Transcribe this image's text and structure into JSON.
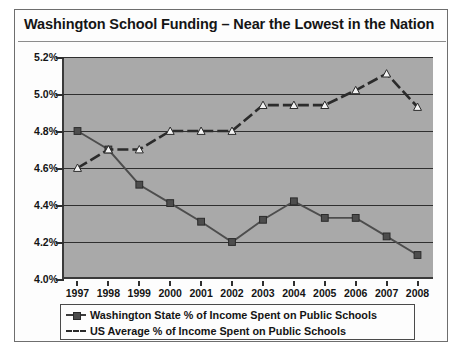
{
  "chart_data": {
    "type": "line",
    "title": "Washington School Funding –  Near the Lowest in the Nation",
    "xlabel": "",
    "ylabel": "",
    "ylim": [
      4.0,
      5.2
    ],
    "ytick_labels": [
      "5.2%",
      "5.0%",
      "4.8%",
      "4.6%",
      "4.4%",
      "4.2%",
      "4.0%"
    ],
    "ytick_values": [
      5.2,
      5.0,
      4.8,
      4.6,
      4.4,
      4.2,
      4.0
    ],
    "grid": true,
    "legend_position": "bottom",
    "categories": [
      "1997",
      "1998",
      "1999",
      "2000",
      "2001",
      "2002",
      "2003",
      "2004",
      "2005",
      "2006",
      "2007",
      "2008"
    ],
    "series": [
      {
        "name": "Washington State % of Income Spent on Public Schools",
        "style": "solid",
        "marker": "square",
        "color": "#4d4d4d",
        "values": [
          4.8,
          4.7,
          4.51,
          4.41,
          4.31,
          4.2,
          4.32,
          4.42,
          4.33,
          4.33,
          4.23,
          4.13
        ]
      },
      {
        "name": "US Average % of Income Spent on Public Schools",
        "style": "dashed",
        "marker": "triangle",
        "color": "#2b2b2b",
        "values": [
          4.6,
          4.7,
          4.7,
          4.8,
          4.8,
          4.8,
          4.94,
          4.94,
          4.94,
          5.02,
          5.11,
          4.93
        ]
      }
    ]
  },
  "colors": {
    "plot_background": "#a9a9a9",
    "axis": "#2f2f2f",
    "frame": "#6e6e6e",
    "text": "#141414"
  }
}
